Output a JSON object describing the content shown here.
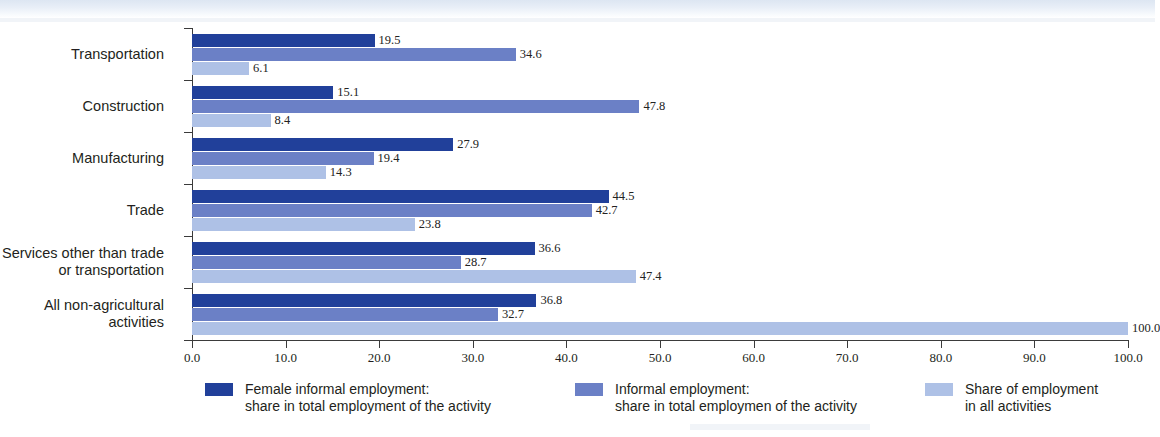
{
  "page": {
    "top_title_fragment": "",
    "background_color": "#ffffff"
  },
  "colors": {
    "series_dark": "#21409a",
    "series_medium": "#6b80c6",
    "series_light": "#aec1e6",
    "axis": "#3b3b3b",
    "text": "#231f20"
  },
  "chart_data": {
    "type": "bar",
    "orientation": "horizontal",
    "title": "",
    "subtitle": "",
    "xlabel": "",
    "ylabel": "",
    "xlim": [
      0,
      100
    ],
    "grid": false,
    "legend_position": "bottom",
    "categories": [
      "Transportation",
      "Construction",
      "Manufacturing",
      "Trade",
      "Services other than trade\nor transportation",
      "All non-agricultural\nactivities"
    ],
    "tick_labels": [
      "0.0",
      "10.0",
      "20.0",
      "30.0",
      "40.0",
      "50.0",
      "60.0",
      "70.0",
      "80.0",
      "90.0",
      "100.0"
    ],
    "tick_values": [
      0,
      10,
      20,
      30,
      40,
      50,
      60,
      70,
      80,
      90,
      100
    ],
    "series": [
      {
        "name": "Female informal employment:\nshare in total employment of the activity",
        "color": "#21409a",
        "values": [
          19.5,
          15.1,
          27.9,
          44.5,
          36.6,
          36.8
        ],
        "labels": [
          "19.5",
          "15.1",
          "27.9",
          "44.5",
          "36.6",
          "36.8"
        ]
      },
      {
        "name": "Informal employment:\nshare in total employmen of the activity",
        "color": "#6b80c6",
        "values": [
          34.6,
          47.8,
          19.4,
          42.7,
          28.7,
          32.7
        ],
        "labels": [
          "34.6",
          "47.8",
          "19.4",
          "42.7",
          "28.7",
          "32.7"
        ]
      },
      {
        "name": "Share of employment\nin all activities",
        "color": "#aec1e6",
        "values": [
          6.1,
          8.4,
          14.3,
          23.8,
          47.4,
          100.0
        ],
        "labels": [
          "6.1",
          "8.4",
          "14.3",
          "23.8",
          "47.4",
          "100.0"
        ]
      }
    ]
  },
  "legend": {
    "items": [
      {
        "label": "Female informal employment:\nshare in total employment of the activity",
        "color": "#21409a"
      },
      {
        "label": "Informal employment:\nshare in total employmen of the activity",
        "color": "#6b80c6"
      },
      {
        "label": "Share of employment\nin all activities",
        "color": "#aec1e6"
      }
    ]
  }
}
